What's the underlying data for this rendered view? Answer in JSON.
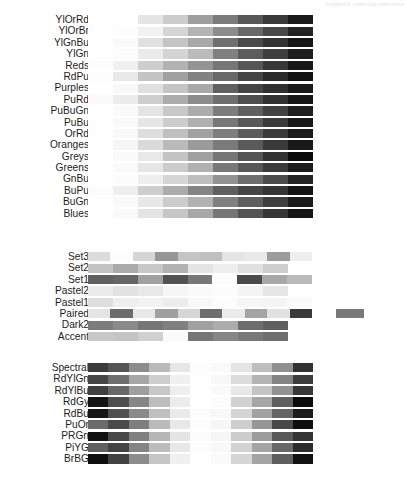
{
  "figure": {
    "title_faint": "matplotlib colormap reference",
    "background": "#ffffff",
    "width": 407,
    "height": 494
  },
  "chart_data": {
    "type": "heatmap",
    "xlabel": "",
    "ylabel": "",
    "grid": false,
    "legend": "none",
    "note": "Each row is a discretized colormap rendered as a horizontal strip of swatches; values are 0-255 grayscale levels left-to-right.",
    "groups": [
      {
        "name": "sequential",
        "bar_left": 88,
        "bar_right": 313,
        "rows": [
          {
            "label": "YlOrRd",
            "values": [
              255,
              254,
              229,
              204,
              158,
              122,
              88,
              58,
              26
            ]
          },
          {
            "label": "YlOrBr",
            "values": [
              255,
              253,
              241,
              213,
              180,
              140,
              104,
              72,
              36
            ]
          },
          {
            "label": "YlGnBu",
            "values": [
              255,
              250,
              224,
              196,
              168,
              112,
              74,
              50,
              22
            ]
          },
          {
            "label": "YlGn",
            "values": [
              255,
              252,
              235,
              212,
              186,
              128,
              92,
              62,
              30
            ]
          },
          {
            "label": "Reds",
            "values": [
              252,
              240,
              206,
              178,
              148,
              118,
              86,
              56,
              24
            ]
          },
          {
            "label": "RdPu",
            "values": [
              253,
              232,
              196,
              160,
              130,
              104,
              70,
              42,
              18
            ]
          },
          {
            "label": "Purples",
            "values": [
              255,
              248,
              224,
              196,
              168,
              96,
              68,
              48,
              26
            ]
          },
          {
            "label": "PuRd",
            "values": [
              250,
              236,
              206,
              172,
              140,
              110,
              78,
              50,
              22
            ]
          },
          {
            "label": "PuBuGn",
            "values": [
              255,
              250,
              228,
              200,
              172,
              124,
              96,
              66,
              30
            ]
          },
          {
            "label": "PuBu",
            "values": [
              255,
              250,
              230,
              204,
              176,
              120,
              88,
              58,
              24
            ]
          },
          {
            "label": "OrRd",
            "values": [
              255,
              248,
              222,
              192,
              162,
              126,
              92,
              60,
              26
            ]
          },
          {
            "label": "Oranges",
            "values": [
              255,
              246,
              218,
              186,
              154,
              122,
              90,
              58,
              26
            ]
          },
          {
            "label": "Greys",
            "values": [
              255,
              250,
              232,
              196,
              160,
              118,
              84,
              50,
              10
            ]
          },
          {
            "label": "Greens",
            "values": [
              255,
              250,
              230,
              204,
              176,
              120,
              88,
              58,
              28
            ]
          },
          {
            "label": "GnBu",
            "values": [
              255,
              252,
              238,
              214,
              190,
              146,
              110,
              76,
              36
            ]
          },
          {
            "label": "BuPu",
            "values": [
              252,
              238,
              206,
              172,
              132,
              96,
              70,
              52,
              20
            ]
          },
          {
            "label": "BuGn",
            "values": [
              255,
              250,
              232,
              204,
              178,
              128,
              94,
              62,
              28
            ]
          },
          {
            "label": "Blues",
            "values": [
              255,
              250,
              228,
              198,
              168,
              118,
              84,
              54,
              22
            ]
          }
        ]
      },
      {
        "name": "qualitative",
        "bar_left": 88,
        "rows": [
          {
            "label": "Set3",
            "bar_width": 224,
            "values": [
              220,
              253,
              214,
              150,
              196,
              192,
              228,
              232,
              156,
              238
            ],
            "extra_offset": null
          },
          {
            "label": "Set2",
            "bar_width": 200,
            "values": [
              196,
              170,
              200,
              178,
              228,
              238,
              224,
              206
            ]
          },
          {
            "label": "Set1",
            "bar_width": 224,
            "values": [
              96,
              102,
              160,
              82,
              120,
              252,
              74,
              168,
              186
            ]
          },
          {
            "label": "Pastel2",
            "bar_width": 200,
            "values": [
              236,
              226,
              232,
              246,
              250,
              252,
              244,
              230
            ]
          },
          {
            "label": "Pastel1",
            "bar_width": 224,
            "values": [
              222,
              238,
              242,
              236,
              248,
              252,
              246,
              244,
              250
            ]
          },
          {
            "label": "Paired",
            "bar_width": 224,
            "values": [
              228,
              108,
              232,
              160,
              214,
              110,
              234,
              164,
              226,
              58
            ],
            "extra_offset": 336,
            "extra_width": 28,
            "extra_value": 120
          },
          {
            "label": "Dark2",
            "bar_width": 200,
            "values": [
              124,
              138,
              118,
              128,
              160,
              172,
              110,
              96
            ]
          },
          {
            "label": "Accent",
            "bar_width": 200,
            "values": [
              200,
              196,
              208,
              250,
              118,
              134,
              120,
              110
            ]
          }
        ]
      },
      {
        "name": "diverging",
        "bar_left": 88,
        "bar_right": 313,
        "rows": [
          {
            "label": "Spectral",
            "values": [
              60,
              84,
              140,
              186,
              230,
              253,
              250,
              228,
              190,
              144,
              50
            ]
          },
          {
            "label": "RdYlGn",
            "values": [
              70,
              110,
              166,
              206,
              240,
              254,
              248,
              220,
              180,
              132,
              60
            ]
          },
          {
            "label": "RdYlBu",
            "values": [
              64,
              104,
              158,
              200,
              238,
              254,
              250,
              232,
              196,
              146,
              56
            ]
          },
          {
            "label": "RdGy",
            "values": [
              20,
              78,
              134,
              190,
              236,
              255,
              252,
              210,
              166,
              96,
              12
            ]
          },
          {
            "label": "RdBu",
            "values": [
              22,
              80,
              138,
              192,
              234,
              252,
              248,
              212,
              162,
              100,
              28
            ]
          },
          {
            "label": "PuOr",
            "values": [
              108,
              74,
              126,
              186,
              232,
              252,
              246,
              206,
              150,
              72,
              14
            ]
          },
          {
            "label": "PRGn",
            "values": [
              16,
              72,
              128,
              182,
              228,
              252,
              246,
              204,
              156,
              88,
              52
            ]
          },
          {
            "label": "PiYG",
            "values": [
              96,
              68,
              132,
              188,
              232,
              252,
              248,
              210,
              164,
              104,
              44
            ]
          },
          {
            "label": "BrBG",
            "values": [
              14,
              66,
              140,
              198,
              240,
              254,
              250,
              214,
              164,
              94,
              18
            ]
          }
        ]
      }
    ]
  }
}
